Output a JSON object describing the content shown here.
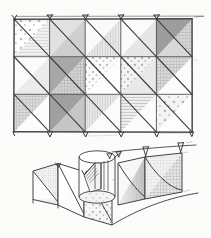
{
  "meta": {
    "medium": "pencil sketch on white paper",
    "background_color": "#fdfdfc",
    "ink_color": "#3a3a3a",
    "canvas": {
      "width": 211,
      "height": 238
    }
  },
  "figures": [
    {
      "id": "elevation",
      "label": "panel-grid-elevation",
      "caption": ""
    },
    {
      "id": "perspective",
      "label": "curved-screen-perspective",
      "caption": ""
    }
  ],
  "elevation": {
    "label": "panel-grid-elevation",
    "columns": 5,
    "rows": 3,
    "x": 14,
    "y": 19,
    "width": 178,
    "height": 113,
    "cell_width": 35.6,
    "cell_height": 37.667,
    "diagonal_direction": "top-left-to-bottom-right",
    "top_fasteners": 5,
    "bottom_fasteners": 5,
    "cells": [
      {
        "row": 0,
        "col": 0,
        "upper_pattern": "dots",
        "upper_tone": "#ffffff",
        "lower_pattern": "horizontal-lines",
        "lower_tone": "#f2f2f2"
      },
      {
        "row": 0,
        "col": 1,
        "upper_pattern": "horizontal-lines",
        "upper_tone": "#efefef",
        "lower_pattern": "solid-mid",
        "lower_tone": "#cfcfcf"
      },
      {
        "row": 0,
        "col": 2,
        "upper_pattern": "blank",
        "upper_tone": "#fafafa",
        "lower_pattern": "vertical-lines",
        "lower_tone": "#ededed"
      },
      {
        "row": 0,
        "col": 3,
        "upper_pattern": "blank",
        "upper_tone": "#fbfbfb",
        "lower_pattern": "solid-light",
        "lower_tone": "#e6e6e6"
      },
      {
        "row": 0,
        "col": 4,
        "upper_pattern": "solid-dark",
        "upper_tone": "#9e9e9e",
        "lower_pattern": "grid-check",
        "lower_tone": "#d8d8d8"
      },
      {
        "row": 1,
        "col": 0,
        "upper_pattern": "blank",
        "upper_tone": "#fbfbfb",
        "lower_pattern": "solid-light",
        "lower_tone": "#ebebeb"
      },
      {
        "row": 1,
        "col": 1,
        "upper_pattern": "solid-dark",
        "upper_tone": "#a8a8a8",
        "lower_pattern": "grid-check",
        "lower_tone": "#d4d4d4"
      },
      {
        "row": 1,
        "col": 2,
        "upper_pattern": "dots",
        "upper_tone": "#fafafa",
        "lower_pattern": "blank",
        "lower_tone": "#fdfdfd"
      },
      {
        "row": 1,
        "col": 3,
        "upper_pattern": "dots",
        "upper_tone": "#f3f3f3",
        "lower_pattern": "solid-light",
        "lower_tone": "#e9e9e9"
      },
      {
        "row": 1,
        "col": 4,
        "upper_pattern": "grid-check",
        "upper_tone": "#dadada",
        "lower_pattern": "blank",
        "lower_tone": "#fcfcfc"
      },
      {
        "row": 2,
        "col": 0,
        "upper_pattern": "grid-check",
        "upper_tone": "#dcdcdc",
        "lower_pattern": "blank",
        "lower_tone": "#fcfcfc"
      },
      {
        "row": 2,
        "col": 1,
        "upper_pattern": "solid-dark",
        "upper_tone": "#a0a0a0",
        "lower_pattern": "solid-mid",
        "lower_tone": "#c6c6c6"
      },
      {
        "row": 2,
        "col": 2,
        "upper_pattern": "vertical-lines",
        "upper_tone": "#ececec",
        "lower_pattern": "blank",
        "lower_tone": "#fbfbfb"
      },
      {
        "row": 2,
        "col": 3,
        "upper_pattern": "horizontal-lines",
        "upper_tone": "#f0f0f0",
        "lower_pattern": "blank",
        "lower_tone": "#fcfcfc"
      },
      {
        "row": 2,
        "col": 4,
        "upper_pattern": "dots",
        "upper_tone": "#f4f4f4",
        "lower_pattern": "blank",
        "lower_tone": "#fdfdfd"
      }
    ]
  },
  "perspective": {
    "label": "curved-screen-perspective",
    "x": 22,
    "y": 150,
    "width": 180,
    "height": 84,
    "elements": [
      {
        "id": "left-wing-panel-a",
        "name": "left-wing-panel-a",
        "pattern": "grid-check",
        "tone": "#e2e2e2"
      },
      {
        "id": "left-wing-panel-b",
        "name": "left-wing-panel-b",
        "pattern": "blank",
        "tone": "#f7f7f7"
      },
      {
        "id": "center-panel-dots",
        "name": "center-panel-dots",
        "pattern": "dots",
        "tone": "#f2f2f2"
      },
      {
        "id": "center-cylinder",
        "name": "center-cylinder-core",
        "pattern": "blank",
        "tone": "#fafafa"
      },
      {
        "id": "spiral-stair",
        "name": "spiral-stair-ramp",
        "pattern": "hatch",
        "tone": "#ededed"
      },
      {
        "id": "right-panel-shade",
        "name": "right-panel-gradient",
        "pattern": "vertical-lines",
        "tone": "#dcdcdc"
      },
      {
        "id": "right-panel-check",
        "name": "right-panel-check",
        "pattern": "grid-check",
        "tone": "#d9d9d9"
      }
    ],
    "top_fasteners": 4
  },
  "patterns": {
    "dots": "scattered-round-dots",
    "grid-check": "fine-square-grid",
    "horizontal-lines": "horizontal-hatching",
    "vertical-lines": "vertical-hatching",
    "solid-dark": "dark-grey-wash",
    "solid-mid": "medium-grey-wash",
    "solid-light": "light-grey-wash",
    "blank": "unfilled-paper",
    "hatch": "diagonal-hatching"
  }
}
